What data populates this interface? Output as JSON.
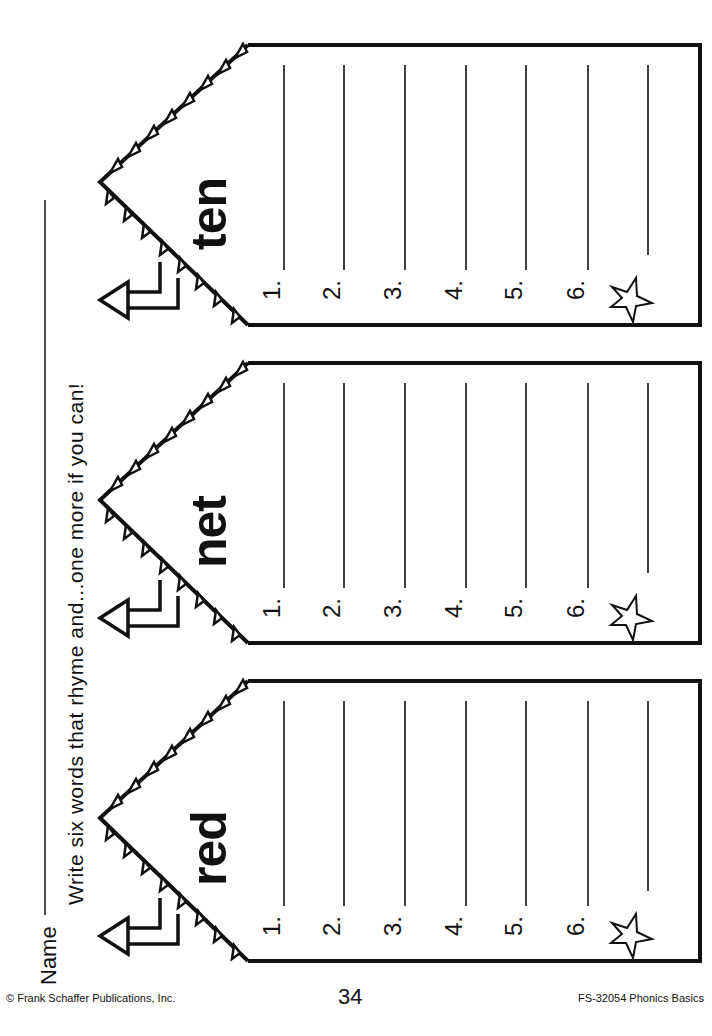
{
  "worksheet": {
    "name_label": "Name",
    "instruction": "Write six words that rhyme and...one more if you can!",
    "houses": [
      {
        "word": "ten",
        "lines": [
          "1.",
          "2.",
          "3.",
          "4.",
          "5.",
          "6."
        ],
        "bonus_icon": "star-icon"
      },
      {
        "word": "net",
        "lines": [
          "1.",
          "2.",
          "3.",
          "4.",
          "5.",
          "6."
        ],
        "bonus_icon": "star-icon"
      },
      {
        "word": "red",
        "lines": [
          "1.",
          "2.",
          "3.",
          "4.",
          "5.",
          "6."
        ],
        "bonus_icon": "star-icon"
      }
    ]
  },
  "footer": {
    "copyright": "© Frank Schaffer Publications, Inc.",
    "page_number": "34",
    "product": "FS-32054 Phonics Basics"
  }
}
